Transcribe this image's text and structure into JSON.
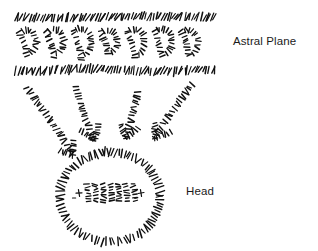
{
  "diagram": {
    "title_labels": {
      "astral_plane": "Astral Plane",
      "head": "Head"
    },
    "style": {
      "ink_color": "#111111",
      "background_color": "#ffffff",
      "stroke_style": "hand-drawn-hatched",
      "label_color": "#1a1a1a"
    },
    "elements": {
      "astral_plane_band": {
        "name": "astral-plane-band",
        "top_border_y": 17,
        "bottom_border_y": 70,
        "left_x": 16,
        "right_x": 215,
        "border_hatch_count": 72,
        "wave_glyph_count": 7
      },
      "head_circle": {
        "name": "head-circle",
        "center_x": 110,
        "center_y": 197,
        "radius_x": 50,
        "radius_y": 45,
        "inner_mark_count": 9
      },
      "arrows": [
        {
          "name": "arrow-1",
          "x1": 27,
          "y1": 88,
          "x2": 73,
          "y2": 155
        },
        {
          "name": "arrow-2",
          "x1": 76,
          "y1": 87,
          "x2": 94,
          "y2": 140
        },
        {
          "name": "arrow-3",
          "x1": 137,
          "y1": 92,
          "x2": 126,
          "y2": 138
        },
        {
          "name": "arrow-4",
          "x1": 192,
          "y1": 85,
          "x2": 155,
          "y2": 138
        }
      ]
    }
  }
}
